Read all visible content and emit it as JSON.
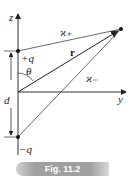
{
  "figure": {
    "caption": "Fig. 11.2",
    "labels": {
      "z_axis": "z",
      "y_axis": "y",
      "plus_charge": "+q",
      "minus_charge": "−q",
      "angle": "θ",
      "separation": "d",
      "r_vector": "r",
      "r_plus": "ϰ₊",
      "r_minus": "ϰ₋"
    }
  }
}
